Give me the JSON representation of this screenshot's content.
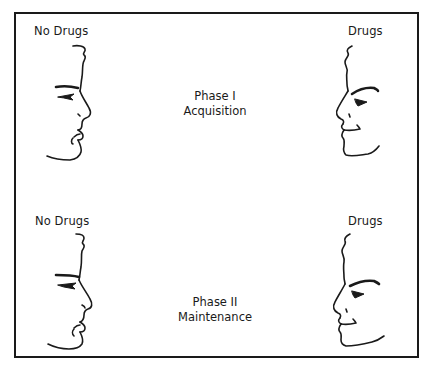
{
  "figure": {
    "phase1": {
      "left_label": "No Drugs",
      "right_label": "Drugs",
      "title_line1": "Phase I",
      "title_line2": "Acquisition",
      "left_face_icon": "face-profile-no-drugs-icon",
      "right_face_icon": "face-profile-drugs-icon"
    },
    "phase2": {
      "left_label": "No Drugs",
      "right_label": "Drugs",
      "title_line1": "Phase II",
      "title_line2": "Maintenance",
      "left_face_icon": "face-profile-no-drugs-icon",
      "right_face_icon": "face-profile-drugs-icon"
    }
  },
  "colors": {
    "stroke": "#1a1a1a",
    "background": "#ffffff"
  }
}
